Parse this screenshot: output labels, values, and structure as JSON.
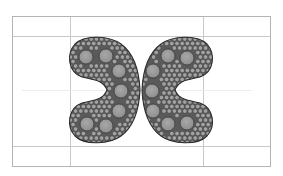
{
  "figure": {
    "width": 283,
    "height": 176,
    "frame": {
      "x": 12,
      "y": 16,
      "w": 258,
      "h": 150,
      "stroke": "#b4b4b4"
    },
    "grid": {
      "vertical": [
        70,
        203
      ],
      "horizontal": [
        36,
        146
      ],
      "midline": {
        "y": 90,
        "x1": 22,
        "x2": 252,
        "stroke": "#ececec"
      },
      "stroke": "#c8c8c8"
    },
    "colors": {
      "region_fill": "#5a5a5a",
      "region_outline": "#2e2e2e",
      "large_circle_fill": "#8e8e8e",
      "large_circle_highlight": "#a8a8a8",
      "large_circle_stroke": "#3c3c3c",
      "small_circle_fill": "#a2a2a2",
      "small_circle_stroke": "#4a4a4a"
    },
    "shapes": [
      {
        "name": "left-c-shape",
        "path": "M121,44 C110,36 85,34 75,44 C66,54 68,72 82,77 C95,80 103,80 107,90 C103,100 95,100 82,103 C68,108 66,126 75,136 C85,146 110,144 121,136 C132,128 139,112 140,90 C139,68 132,52 121,44 Z",
        "large_circles": [
          {
            "cx": 86,
            "cy": 57,
            "r": 7
          },
          {
            "cx": 106,
            "cy": 56,
            "r": 7
          },
          {
            "cx": 119,
            "cy": 71,
            "r": 7
          },
          {
            "cx": 121,
            "cy": 91,
            "r": 7
          },
          {
            "cx": 119,
            "cy": 111,
            "r": 7
          },
          {
            "cx": 87,
            "cy": 124,
            "r": 7
          },
          {
            "cx": 106,
            "cy": 126,
            "r": 7
          }
        ]
      },
      {
        "name": "right-c-shape",
        "path": "M161,44 C172,36 197,34 207,44 C216,54 214,72 200,77 C187,80 179,80 175,90 C179,100 187,100 200,103 C214,108 216,126 207,136 C197,146 172,144 161,136 C150,128 143,112 142,90 C143,68 150,52 161,44 Z",
        "large_circles": [
          {
            "cx": 168,
            "cy": 56,
            "r": 7
          },
          {
            "cx": 187,
            "cy": 58,
            "r": 7
          },
          {
            "cx": 153,
            "cy": 71,
            "r": 7
          },
          {
            "cx": 152,
            "cy": 91,
            "r": 7
          },
          {
            "cx": 153,
            "cy": 111,
            "r": 7
          },
          {
            "cx": 168,
            "cy": 124,
            "r": 7
          },
          {
            "cx": 187,
            "cy": 123,
            "r": 7
          }
        ]
      }
    ],
    "small_circles": {
      "r": 2.3,
      "spacing": 5.2
    }
  }
}
